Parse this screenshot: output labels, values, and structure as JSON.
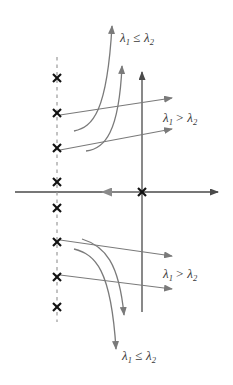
{
  "figure": {
    "type": "phase-portrait-diagram",
    "title": "",
    "colors": {
      "axis": "#4a4a4a",
      "arrow": "#7a7a7a",
      "curve": "#7a7a7a",
      "marker": "#111111",
      "dashed_line": "#9a9a9a",
      "label_text": "#3a3a3a",
      "background": "#ffffff"
    },
    "axes": {
      "horizontal": {
        "x_start": 15,
        "x_end": 222,
        "y": 192,
        "arrow_at": "right"
      },
      "vertical": {
        "x": 142,
        "y_start": 312,
        "y_end": 68,
        "arrow_at": "top"
      },
      "origin": {
        "x": 142,
        "y": 192
      }
    },
    "dashed_line": {
      "x": 57,
      "y_top": 57,
      "y_bottom": 322,
      "style": "dashed"
    },
    "markers": {
      "glyph": "x",
      "symbol_name": "cross-marker",
      "on_dashed_line": [
        {
          "x": 57,
          "y": 78
        },
        {
          "x": 57,
          "y": 113
        },
        {
          "x": 57,
          "y": 148
        },
        {
          "x": 57,
          "y": 182
        },
        {
          "x": 57,
          "y": 208
        },
        {
          "x": 57,
          "y": 242
        },
        {
          "x": 57,
          "y": 277
        },
        {
          "x": 57,
          "y": 307
        }
      ],
      "at_origin": {
        "x": 142,
        "y": 192
      }
    },
    "labels": [
      {
        "id": "label-top",
        "lambda1": "λ",
        "sub1": "1",
        "operator": "≤",
        "lambda2": "λ",
        "sub2": "2",
        "text": "λ1 ≤ λ2",
        "x": 120,
        "y": 42
      },
      {
        "id": "label-upper-right",
        "lambda1": "λ",
        "sub1": "1",
        "operator": ">",
        "lambda2": "λ",
        "sub2": "2",
        "text": "λ1 > λ2",
        "x": 163,
        "y": 122
      },
      {
        "id": "label-lower-right",
        "lambda1": "λ",
        "sub1": "1",
        "operator": ">",
        "lambda2": "λ",
        "sub2": "2",
        "text": "λ1 > λ2",
        "x": 163,
        "y": 278
      },
      {
        "id": "label-bottom",
        "lambda1": "λ",
        "sub1": "1",
        "operator": "≤",
        "lambda2": "λ",
        "sub2": "2",
        "text": "λ1 ≤ λ2",
        "x": 122,
        "y": 360
      }
    ],
    "arrows": {
      "straight": [
        {
          "id": "arrow-upper-1",
          "x1": 60,
          "y1": 115,
          "x2": 178,
          "y2": 97
        },
        {
          "id": "arrow-upper-2",
          "x1": 60,
          "y1": 150,
          "x2": 178,
          "y2": 128
        },
        {
          "id": "arrow-lower-1",
          "x1": 60,
          "y1": 240,
          "x2": 178,
          "y2": 257
        },
        {
          "id": "arrow-lower-2",
          "x1": 60,
          "y1": 275,
          "x2": 178,
          "y2": 290
        },
        {
          "id": "arrow-axis-left",
          "x1": 140,
          "y1": 192,
          "x2": 96,
          "y2": 192
        }
      ],
      "curves": [
        {
          "id": "curve-top-outer",
          "path": "M 74,130 C 92,126 106,110 112,22",
          "tip": {
            "x": 112,
            "y": 18
          }
        },
        {
          "id": "curve-top-inner",
          "path": "M 86,150 C 104,148 118,130 122,62",
          "tip": {
            "x": 122,
            "y": 58
          }
        },
        {
          "id": "curve-bottom-outer",
          "path": "M 74,250 C 94,254 110,268 116,352",
          "tip": {
            "x": 116,
            "y": 357
          }
        },
        {
          "id": "curve-bottom-inner",
          "path": "M 82,240 C 104,246 118,262 124,318",
          "tip": {
            "x": 124,
            "y": 323
          }
        }
      ]
    }
  }
}
